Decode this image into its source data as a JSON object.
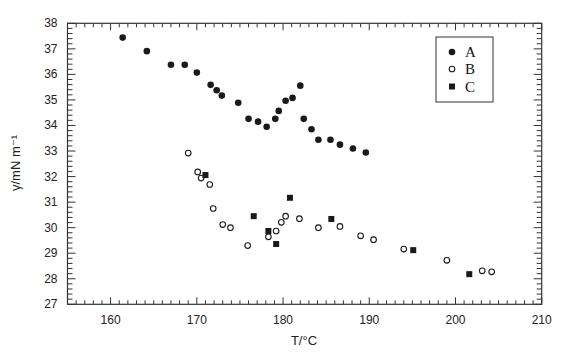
{
  "chart_data": {
    "type": "scatter",
    "title": "",
    "xlabel": "T/°C",
    "ylabel": "γ/mN m⁻¹",
    "xlim": [
      155,
      210
    ],
    "ylim": [
      27,
      38
    ],
    "x_ticks": [
      160,
      170,
      180,
      190,
      200,
      210
    ],
    "y_ticks": [
      27,
      28,
      29,
      30,
      31,
      32,
      33,
      34,
      35,
      36,
      37,
      38
    ],
    "x_minor_step": 1,
    "y_minor_step": 0.2,
    "grid": false,
    "legend_position": "upper right (inset box)",
    "series": [
      {
        "name": "A",
        "marker": "filled-circle",
        "points": [
          [
            161.4,
            37.44
          ],
          [
            164.2,
            36.91
          ],
          [
            167.0,
            36.38
          ],
          [
            168.6,
            36.38
          ],
          [
            170.0,
            36.07
          ],
          [
            171.6,
            35.59
          ],
          [
            172.3,
            35.38
          ],
          [
            172.9,
            35.17
          ],
          [
            174.8,
            34.89
          ],
          [
            176.0,
            34.26
          ],
          [
            177.1,
            34.15
          ],
          [
            178.1,
            33.95
          ],
          [
            179.1,
            34.26
          ],
          [
            179.5,
            34.57
          ],
          [
            180.3,
            34.97
          ],
          [
            181.1,
            35.08
          ],
          [
            182.0,
            35.56
          ],
          [
            182.4,
            34.26
          ],
          [
            183.3,
            33.85
          ],
          [
            184.1,
            33.44
          ],
          [
            185.5,
            33.44
          ],
          [
            186.6,
            33.25
          ],
          [
            188.1,
            33.1
          ],
          [
            189.6,
            32.94
          ]
        ]
      },
      {
        "name": "B",
        "marker": "open-circle",
        "points": [
          [
            169.0,
            32.92
          ],
          [
            170.1,
            32.18
          ],
          [
            170.5,
            31.94
          ],
          [
            171.5,
            31.69
          ],
          [
            171.9,
            30.75
          ],
          [
            173.0,
            30.12
          ],
          [
            173.9,
            30.0
          ],
          [
            175.9,
            29.3
          ],
          [
            178.3,
            29.64
          ],
          [
            179.2,
            29.87
          ],
          [
            179.8,
            30.21
          ],
          [
            180.3,
            30.45
          ],
          [
            181.9,
            30.35
          ],
          [
            184.1,
            30.0
          ],
          [
            186.6,
            30.05
          ],
          [
            189.0,
            29.68
          ],
          [
            190.5,
            29.53
          ],
          [
            194.0,
            29.16
          ],
          [
            199.0,
            28.72
          ],
          [
            203.1,
            28.31
          ],
          [
            204.2,
            28.27
          ]
        ]
      },
      {
        "name": "C",
        "marker": "filled-square",
        "points": [
          [
            171.0,
            32.06
          ],
          [
            176.6,
            30.45
          ],
          [
            178.3,
            29.87
          ],
          [
            179.2,
            29.36
          ],
          [
            180.8,
            31.17
          ],
          [
            185.6,
            30.34
          ],
          [
            195.1,
            29.12
          ],
          [
            201.6,
            28.18
          ]
        ]
      }
    ]
  },
  "colors": {
    "marker": "#1a1a1a",
    "axis": "#333333",
    "background": "#ffffff"
  }
}
